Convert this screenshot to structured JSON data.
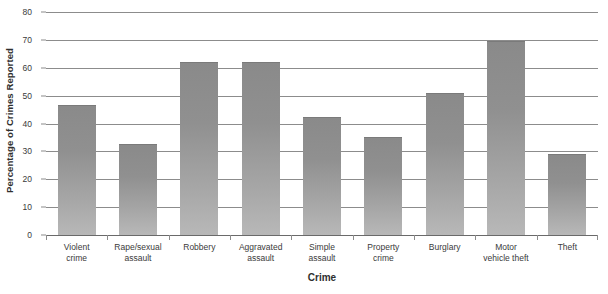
{
  "chart_data": {
    "type": "bar",
    "title": "",
    "xlabel": "Crime",
    "ylabel": "Percentage of Crimes Reported",
    "categories": [
      "Violent crime",
      "Rape/sexual assault",
      "Robbery",
      "Aggravated assault",
      "Simple assault",
      "Property crime",
      "Burglary",
      "Motor vehicle theft",
      "Theft"
    ],
    "category_lines": [
      [
        "Violent",
        "crime"
      ],
      [
        "Rape/sexual",
        "assault"
      ],
      [
        "Robbery"
      ],
      [
        "Aggravated",
        "assault"
      ],
      [
        "Simple",
        "assault"
      ],
      [
        "Property",
        "crime"
      ],
      [
        "Burglary"
      ],
      [
        "Motor",
        "vehicle theft"
      ],
      [
        "Theft"
      ]
    ],
    "values": [
      46.5,
      32.5,
      62,
      62,
      42.5,
      35,
      51,
      69.5,
      29
    ],
    "ylim": [
      0,
      80
    ],
    "yticks": [
      0,
      10,
      20,
      30,
      40,
      50,
      60,
      70,
      80
    ],
    "ytick_labels": [
      "0",
      "10",
      "20",
      "30",
      "40",
      "50",
      "60",
      "70",
      "80"
    ],
    "grid": true,
    "legend": false,
    "bar_color_top": "#8a8a8a",
    "bar_color_bottom": "#b8b8b8",
    "gridline_color": "#8c8c8c",
    "text_color": "#3a3a3a"
  }
}
